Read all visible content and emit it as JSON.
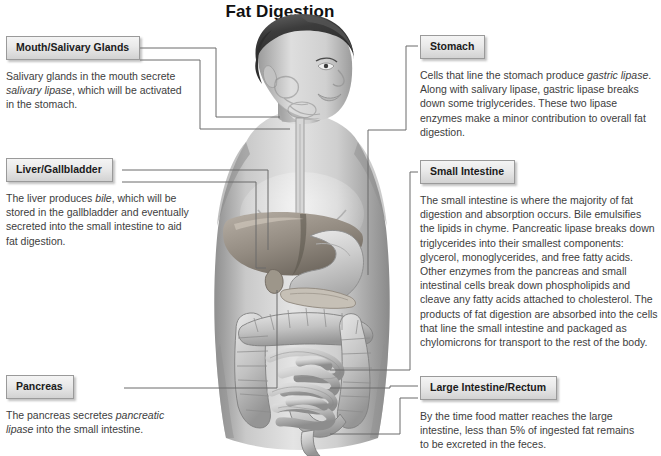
{
  "title": "Fat Digestion",
  "figure": {
    "alt_name": "human-torso-digestive-system-illustration",
    "organs": [
      "mouth",
      "salivary-glands",
      "esophagus",
      "stomach",
      "liver",
      "gallbladder",
      "pancreas",
      "small-intestine",
      "large-intestine",
      "rectum"
    ]
  },
  "callouts": {
    "mouth": {
      "heading": "Mouth/Salivary Glands",
      "text_before": "Salivary glands in the mouth secrete ",
      "emphasis": "salivary lipase",
      "text_after": ", which will be activated in the stomach."
    },
    "liver": {
      "heading": "Liver/Gallbladder",
      "text_before": "The liver produces ",
      "emphasis": "bile",
      "text_after": ", which will be stored in the gallbladder and eventually secreted into the small intestine to aid fat digestion."
    },
    "pancreas": {
      "heading": "Pancreas",
      "text_before": "The pancreas secretes ",
      "emphasis": "pancreatic lipase",
      "text_after": " into the small intestine."
    },
    "stomach": {
      "heading": "Stomach",
      "text_before": "Cells that line the stomach produce ",
      "emphasis": "gastric lipase",
      "text_after": ". Along with salivary lipase, gastric lipase breaks down some triglycerides. These two lipase enzymes make a minor contribution to overall fat digestion."
    },
    "small_intestine": {
      "heading": "Small Intestine",
      "text_before": "The small intestine is where the majority of fat digestion and absorption occurs. Bile emulsifies the lipids in chyme. Pancreatic lipase breaks down triglycerides into their smallest components: glycerol, monoglycerides, and free fatty acids. Other enzymes from the pancreas and small intestinal cells break down phospholipids and cleave any fatty acids attached to cholesterol. The products of fat digestion are absorbed into the cells that line the small intestine and packaged as chylomicrons for transport to the rest of the body.",
      "emphasis": "",
      "text_after": ""
    },
    "large_intestine": {
      "heading": "Large Intestine/Rectum",
      "text_before": "By the time food matter reaches the large intestine, less than 5% of ingested fat remains to be excreted in the feces.",
      "emphasis": "",
      "text_after": ""
    }
  },
  "colors": {
    "leader_line": "#6b6b6b",
    "heading_text": "#1b1b1b",
    "body_text": "#3d3d3d",
    "box_border": "#9a9a9a",
    "background": "#ffffff"
  }
}
